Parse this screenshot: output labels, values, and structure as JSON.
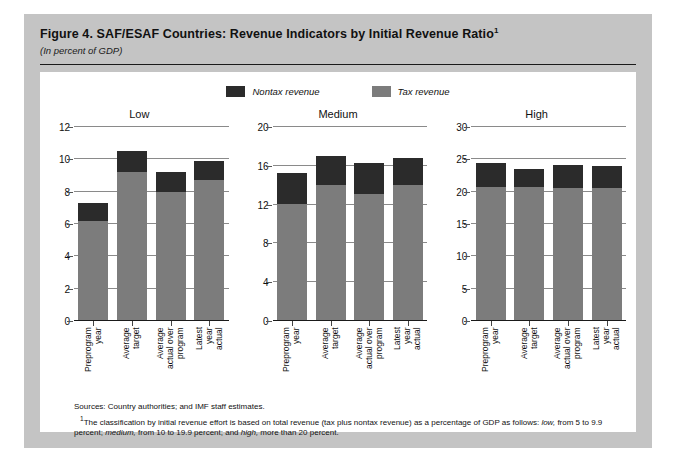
{
  "figure": {
    "title": "Figure 4.  SAF/ESAF Countries: Revenue Indicators by Initial Revenue Ratio",
    "title_footnote_marker": "1",
    "subtitle": "(In percent of GDP)"
  },
  "legend": [
    {
      "label": "Nontax revenue",
      "color": "#2b2b2b"
    },
    {
      "label": "Tax revenue",
      "color": "#7c7c7c"
    }
  ],
  "footer": {
    "sources": "Sources:  Country authorities; and IMF staff estimates.",
    "note_marker": "1",
    "note_part1": "The classification by initial revenue effort is based on total revenue (tax plus nontax revenue) as a percentage of GDP as follows: ",
    "note_low": "low,",
    "note_part2": " from 5 to 9.9 percent; ",
    "note_medium": "medium,",
    "note_part3": " from 10 to 19.9 percent; and ",
    "note_high": "high,",
    "note_part4": " more than 20 percent."
  },
  "chart_data": {
    "type": "bar",
    "title": "Figure 4.  SAF/ESAF Countries: Revenue Indicators by Initial Revenue Ratio",
    "subtitle": "(In percent of GDP)",
    "stacked": true,
    "grid": true,
    "legend_position": "top-center",
    "ylabel": "",
    "xlabel": "",
    "categories": [
      "Preprogram year",
      "Average target",
      "Average actual over program",
      "Latest year actual"
    ],
    "category_lines": [
      [
        "Preprogram",
        "year"
      ],
      [
        "Average",
        "target"
      ],
      [
        "Average",
        "actual over",
        "program"
      ],
      [
        "Latest",
        "year",
        "actual"
      ]
    ],
    "series": [
      {
        "name": "Tax revenue",
        "color": "#7c7c7c"
      },
      {
        "name": "Nontax revenue",
        "color": "#2b2b2b"
      }
    ],
    "panels": [
      {
        "name": "Low",
        "ylim": [
          0,
          12
        ],
        "yticks": [
          0,
          2,
          4,
          6,
          8,
          10,
          12
        ],
        "tax_revenue": [
          6.2,
          9.2,
          8.0,
          8.7
        ],
        "nontax_revenue": [
          1.1,
          1.3,
          1.2,
          1.2
        ],
        "totals": [
          7.3,
          10.5,
          9.2,
          9.9
        ]
      },
      {
        "name": "Medium",
        "ylim": [
          0,
          20
        ],
        "yticks": [
          0,
          4,
          8,
          12,
          16,
          20
        ],
        "tax_revenue": [
          12.1,
          14.0,
          13.1,
          14.0
        ],
        "nontax_revenue": [
          3.2,
          3.0,
          3.2,
          2.8
        ],
        "totals": [
          15.3,
          17.0,
          16.3,
          16.8
        ]
      },
      {
        "name": "High",
        "ylim": [
          0,
          30
        ],
        "yticks": [
          0,
          5,
          10,
          15,
          20,
          25,
          30
        ],
        "tax_revenue": [
          20.8,
          20.7,
          20.5,
          20.5
        ],
        "nontax_revenue": [
          3.7,
          2.8,
          3.7,
          3.4
        ],
        "totals": [
          24.5,
          23.5,
          24.2,
          23.9
        ]
      }
    ]
  }
}
